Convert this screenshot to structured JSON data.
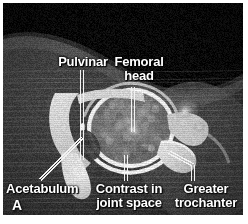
{
  "figure": {
    "type": "medical-ct-image",
    "modality": "CT arthrogram",
    "body_part": "hip",
    "view": "axial",
    "panel_marker": "A",
    "border_color": "#ffffff",
    "plate_background": "#0a0a0a",
    "label_color": "#ffffff",
    "leader_color": "#f2f2f2"
  },
  "annotations": [
    {
      "id": "pulvinar",
      "label": "Pulvinar",
      "label_x": 58,
      "label_y": 55,
      "label_w": 50,
      "align": "center",
      "leader": {
        "style": "double-vertical",
        "x": 82,
        "y_top": 70,
        "y_bottom": 160
      }
    },
    {
      "id": "femoral-head",
      "label": "Femoral\nhead",
      "label_x": 110,
      "label_y": 55,
      "label_w": 58,
      "align": "center",
      "leader": {
        "style": "double-vertical",
        "x": 133,
        "y_top": 87,
        "y_bottom": 132
      }
    },
    {
      "id": "acetabulum",
      "label": "Acetabulum",
      "label_x": 6,
      "label_y": 182,
      "label_w": 78,
      "align": "left",
      "leader": {
        "style": "double-diagonal",
        "x1": 40,
        "y1": 180,
        "x2": 82,
        "y2": 138
      }
    },
    {
      "id": "contrast-joint-space",
      "label": "Contrast in\njoint space",
      "label_x": 93,
      "label_y": 182,
      "label_w": 72,
      "align": "center",
      "leader": {
        "style": "double-vertical",
        "x": 126,
        "y_top": 155,
        "y_bottom": 181
      }
    },
    {
      "id": "greater-trochanter",
      "label": "Greater\ntrochanter",
      "label_x": 170,
      "label_y": 182,
      "label_w": 72,
      "align": "center",
      "leader": {
        "style": "double-elbow",
        "x1": 169,
        "y1": 152,
        "x2": 193,
        "y2": 165,
        "y3": 181
      }
    }
  ]
}
